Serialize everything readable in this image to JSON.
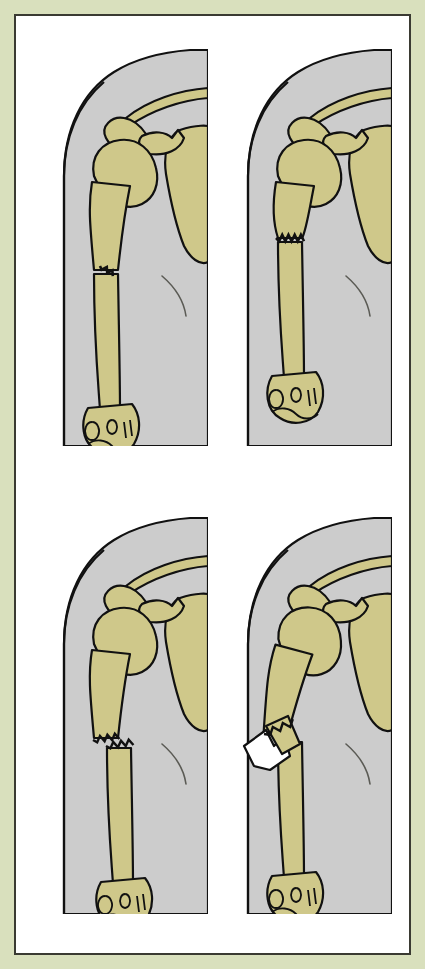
{
  "figure": {
    "panel_count": 4,
    "rows": 2,
    "columns": 2,
    "has_text_labels": false,
    "caption": ""
  },
  "colors": {
    "page_background": "#d9e0bd",
    "frame_border": "#3a3a32",
    "panel_background": "#ffffff",
    "bone_fill": "#cfc88a",
    "bone_outline": "#111111",
    "soft_tissue_fill": "#cccccc",
    "soft_tissue_outline": "#111111",
    "fracture_line": "#111111",
    "skin_breach_fill": "#ffffff"
  },
  "anatomy": {
    "structures": [
      {
        "name": "clavicle",
        "label": "Clavicle"
      },
      {
        "name": "acromion",
        "label": "Acromion"
      },
      {
        "name": "coracoid-process",
        "label": "Coracoid process"
      },
      {
        "name": "humeral-head",
        "label": "Humeral head"
      },
      {
        "name": "greater-tubercle",
        "label": "Greater tubercle"
      },
      {
        "name": "humeral-shaft",
        "label": "Humeral shaft"
      },
      {
        "name": "scapula",
        "label": "Scapula"
      },
      {
        "name": "distal-humerus",
        "label": "Distal humerus / condyles"
      },
      {
        "name": "soft-tissue-outline",
        "label": "Soft tissue / skin outline"
      },
      {
        "name": "chest-fold",
        "label": "Chest wall fold"
      }
    ]
  },
  "panels": [
    {
      "id": "panel-1",
      "position": "top-left",
      "index": 1,
      "fracture_type": "hairline",
      "fracture_name": "Hairline (incomplete) fracture",
      "description": "Small incomplete crack on the lateral cortex of the mid humeral shaft; bone alignment intact.",
      "displacement": "none",
      "skin_intact": true,
      "fracture_level": "mid-shaft",
      "fracture_extent": "partial-width"
    },
    {
      "id": "panel-2",
      "position": "top-right",
      "index": 2,
      "fracture_type": "transverse",
      "fracture_name": "Complete transverse fracture",
      "description": "Jagged fracture line crossing the full width of the humeral shaft; fragments remain aligned.",
      "displacement": "none",
      "skin_intact": true,
      "fracture_level": "upper-mid-shaft",
      "fracture_extent": "full-width"
    },
    {
      "id": "panel-3",
      "position": "bottom-left",
      "index": 3,
      "fracture_type": "displaced",
      "fracture_name": "Displaced closed fracture",
      "description": "Complete fracture with the distal fragment shifted laterally and overriding; skin remains unbroken.",
      "displacement": "lateral",
      "skin_intact": true,
      "fracture_level": "mid-shaft",
      "fracture_extent": "full-width"
    },
    {
      "id": "panel-4",
      "position": "bottom-right",
      "index": 4,
      "fracture_type": "open-compound",
      "fracture_name": "Open (compound) fracture",
      "description": "Angulated fracture in which the sharp proximal fragment pierces the soft tissue and protrudes through the skin.",
      "displacement": "angulated-protruding",
      "skin_intact": false,
      "fracture_level": "mid-shaft",
      "fracture_extent": "full-width"
    }
  ]
}
